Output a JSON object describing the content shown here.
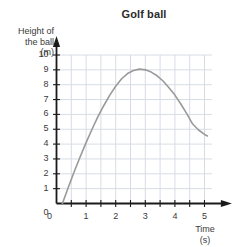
{
  "chart_data": {
    "type": "line",
    "title": "Golf ball",
    "xlabel": "Time",
    "xlabel_unit": "(s)",
    "ylabel_line1": "Height of",
    "ylabel_line2": "the ball",
    "ylabel_unit": "(m)",
    "xlim": [
      0,
      5.25
    ],
    "ylim": [
      0,
      10
    ],
    "xticks_major": [
      0,
      1,
      2,
      3,
      4,
      5
    ],
    "xticks_major_labels": [
      "0",
      "1",
      "2",
      "3",
      "4",
      "5"
    ],
    "xticks_minor_step": 0.5,
    "yticks": [
      0,
      1,
      2,
      3,
      4,
      5,
      6,
      7,
      8,
      9,
      10
    ],
    "yticks_labels": [
      "0",
      "1",
      "2",
      "3",
      "4",
      "5",
      "6",
      "7",
      "8",
      "9",
      "10"
    ],
    "grid": true,
    "grid_x_step": 0.5,
    "grid_y_step": 1,
    "legend": "none",
    "series": [
      {
        "name": "Height of the ball",
        "color": "#9a9a9a",
        "x": [
          0.2,
          0.4,
          0.6,
          0.8,
          1.0,
          1.2,
          1.4,
          1.6,
          1.8,
          2.0,
          2.2,
          2.4,
          2.6,
          2.8,
          3.0,
          3.2,
          3.4,
          3.6,
          3.8,
          4.0,
          4.2,
          4.4,
          4.6,
          4.8,
          5.0,
          5.1
        ],
        "y": [
          0.0,
          1.1,
          2.15,
          3.15,
          4.1,
          5.0,
          5.85,
          6.6,
          7.3,
          7.9,
          8.4,
          8.75,
          8.95,
          9.05,
          9.0,
          8.85,
          8.6,
          8.25,
          7.8,
          7.3,
          6.7,
          6.05,
          5.35,
          4.95,
          4.65,
          4.55
        ],
        "peak_x": 3.0,
        "peak_y": 9.0,
        "start_x": 0.2,
        "start_y": 0.0,
        "end_x": 5.1,
        "end_y": 4.55
      }
    ]
  },
  "axes": {
    "axis_color": "#1a1a1a",
    "grid_color": "#d7dce4",
    "tick_color": "#1a1a1a"
  }
}
